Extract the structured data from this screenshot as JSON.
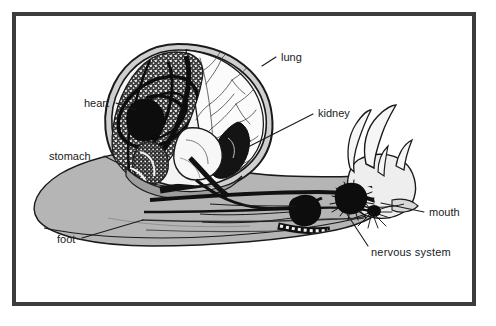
{
  "figure": {
    "kind": "biology-anatomy-diagram",
    "frame_color": "#3c3c3c",
    "background_color": "#ffffff",
    "ink_color": "#1a1a1a",
    "body_fill_color": "#b5b5b5",
    "shell_fill_color": "#c8c8c8",
    "organ_dark_color": "#1a1a1a",
    "stipple_color": "#4a4a4a"
  },
  "labels": [
    {
      "id": "lung",
      "text": "lung",
      "x": 281,
      "y": 57,
      "anchor": "start",
      "leader": "M 276 57 L 262 66"
    },
    {
      "id": "heart",
      "text": "heart",
      "x": 84,
      "y": 104,
      "anchor": "start",
      "leader": "M 116 103 L 132 109"
    },
    {
      "id": "kidney",
      "text": "kidney",
      "x": 317,
      "y": 113,
      "anchor": "start",
      "leader": "M 313 114 L 249 148"
    },
    {
      "id": "stomach",
      "text": "stomach",
      "x": 49,
      "y": 157,
      "anchor": "start",
      "leader": "M 104 156 L 125 167"
    },
    {
      "id": "mouth",
      "text": "mouth",
      "x": 428,
      "y": 215,
      "anchor": "start",
      "leader": "M 424 212 L 381 203"
    },
    {
      "id": "nervous-system",
      "text": "nervous  system",
      "x": 371,
      "y": 252,
      "anchor": "start",
      "leader": "M 368 246 L 347 216"
    },
    {
      "id": "foot",
      "text": "foot",
      "x": 57,
      "y": 241,
      "anchor": "start",
      "leader": "M 82 238 L 143 220"
    }
  ]
}
